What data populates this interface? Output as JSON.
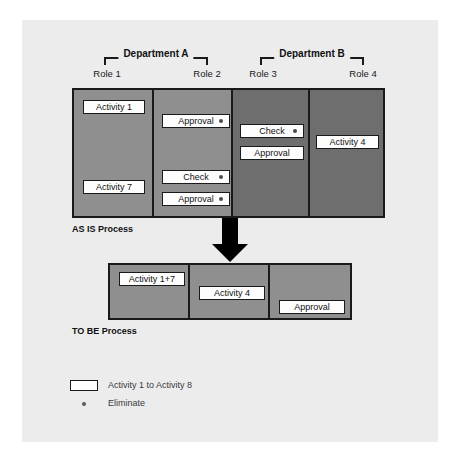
{
  "diagram": {
    "title_asis": "AS IS Process",
    "title_tobe": "TO BE Process",
    "departments": [
      {
        "label": "Department A"
      },
      {
        "label": "Department B"
      }
    ],
    "roles": [
      {
        "label": "Role 1"
      },
      {
        "label": "Role 2"
      },
      {
        "label": "Role 3"
      },
      {
        "label": "Role 4"
      }
    ],
    "asis_activities": [
      {
        "label": "Activity 1",
        "eliminate": false,
        "lane": "Role 1"
      },
      {
        "label": "Activity 7",
        "eliminate": false,
        "lane": "Role 1"
      },
      {
        "label": "Approval",
        "eliminate": true,
        "lane": "Role 2"
      },
      {
        "label": "Check",
        "eliminate": true,
        "lane": "Role 2"
      },
      {
        "label": "Approval",
        "eliminate": true,
        "lane": "Role 2"
      },
      {
        "label": "Check",
        "eliminate": true,
        "lane": "Role 3"
      },
      {
        "label": "Approval",
        "eliminate": false,
        "lane": "Role 3"
      },
      {
        "label": "Activity 4",
        "eliminate": false,
        "lane": "Role 4"
      }
    ],
    "tobe_activities": [
      {
        "label": "Activity 1+7"
      },
      {
        "label": "Activity 4"
      },
      {
        "label": "Approval"
      }
    ],
    "legend": [
      {
        "label": "Activity 1 to Activity 8",
        "marker": "box"
      },
      {
        "label": "Eliminate",
        "marker": "dot"
      }
    ],
    "colors": {
      "page_background": "#ececed",
      "lane_light": "#8f8f8f",
      "lane_dark": "#6e6e6e",
      "outline": "#1a1a1a",
      "activity_fill": "#fdfdfd",
      "arrow": "#000000"
    }
  }
}
